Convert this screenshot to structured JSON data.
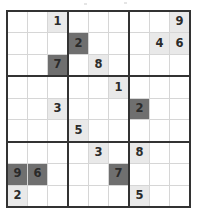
{
  "puzzle": {
    "name": "sudoku-grid",
    "kind": "sudoku",
    "size": 9,
    "box_rows": 3,
    "box_cols": 3,
    "colors": {
      "background": "#ffffff",
      "cell_line": "#d6d6d6",
      "box_line": "#333333",
      "shade_light": "#e9e9e9",
      "shade_dark": "#6f6f6f",
      "digit": "#2b2b2b"
    },
    "legend": {
      "light_label": "light-shaded-cell",
      "dark_label": "dark-shaded-cell",
      "empty_label": "empty-cell"
    },
    "rows": [
      [
        {
          "value": "",
          "shade": "none"
        },
        {
          "value": "",
          "shade": "none"
        },
        {
          "value": "1",
          "shade": "light"
        },
        {
          "value": "",
          "shade": "none"
        },
        {
          "value": "",
          "shade": "none"
        },
        {
          "value": "",
          "shade": "none"
        },
        {
          "value": "",
          "shade": "none"
        },
        {
          "value": "",
          "shade": "none"
        },
        {
          "value": "9",
          "shade": "light"
        }
      ],
      [
        {
          "value": "",
          "shade": "none"
        },
        {
          "value": "",
          "shade": "none"
        },
        {
          "value": "",
          "shade": "none"
        },
        {
          "value": "2",
          "shade": "dark"
        },
        {
          "value": "",
          "shade": "none"
        },
        {
          "value": "",
          "shade": "none"
        },
        {
          "value": "",
          "shade": "none"
        },
        {
          "value": "4",
          "shade": "light"
        },
        {
          "value": "6",
          "shade": "light"
        }
      ],
      [
        {
          "value": "",
          "shade": "none"
        },
        {
          "value": "",
          "shade": "none"
        },
        {
          "value": "7",
          "shade": "dark"
        },
        {
          "value": "",
          "shade": "none"
        },
        {
          "value": "8",
          "shade": "light"
        },
        {
          "value": "",
          "shade": "none"
        },
        {
          "value": "",
          "shade": "none"
        },
        {
          "value": "",
          "shade": "none"
        },
        {
          "value": "",
          "shade": "none"
        }
      ],
      [
        {
          "value": "",
          "shade": "none"
        },
        {
          "value": "",
          "shade": "none"
        },
        {
          "value": "",
          "shade": "none"
        },
        {
          "value": "",
          "shade": "none"
        },
        {
          "value": "",
          "shade": "none"
        },
        {
          "value": "1",
          "shade": "light"
        },
        {
          "value": "",
          "shade": "none"
        },
        {
          "value": "",
          "shade": "none"
        },
        {
          "value": "",
          "shade": "none"
        }
      ],
      [
        {
          "value": "",
          "shade": "none"
        },
        {
          "value": "",
          "shade": "none"
        },
        {
          "value": "3",
          "shade": "light"
        },
        {
          "value": "",
          "shade": "none"
        },
        {
          "value": "",
          "shade": "none"
        },
        {
          "value": "",
          "shade": "none"
        },
        {
          "value": "2",
          "shade": "dark"
        },
        {
          "value": "",
          "shade": "none"
        },
        {
          "value": "",
          "shade": "none"
        }
      ],
      [
        {
          "value": "",
          "shade": "none"
        },
        {
          "value": "",
          "shade": "none"
        },
        {
          "value": "",
          "shade": "none"
        },
        {
          "value": "5",
          "shade": "light"
        },
        {
          "value": "",
          "shade": "none"
        },
        {
          "value": "",
          "shade": "none"
        },
        {
          "value": "",
          "shade": "none"
        },
        {
          "value": "",
          "shade": "none"
        },
        {
          "value": "",
          "shade": "none"
        }
      ],
      [
        {
          "value": "",
          "shade": "none"
        },
        {
          "value": "",
          "shade": "none"
        },
        {
          "value": "",
          "shade": "none"
        },
        {
          "value": "",
          "shade": "none"
        },
        {
          "value": "3",
          "shade": "light"
        },
        {
          "value": "",
          "shade": "none"
        },
        {
          "value": "8",
          "shade": "light"
        },
        {
          "value": "",
          "shade": "none"
        },
        {
          "value": "",
          "shade": "none"
        }
      ],
      [
        {
          "value": "9",
          "shade": "dark"
        },
        {
          "value": "6",
          "shade": "dark"
        },
        {
          "value": "",
          "shade": "none"
        },
        {
          "value": "",
          "shade": "none"
        },
        {
          "value": "",
          "shade": "none"
        },
        {
          "value": "7",
          "shade": "dark"
        },
        {
          "value": "",
          "shade": "none"
        },
        {
          "value": "",
          "shade": "none"
        },
        {
          "value": "",
          "shade": "none"
        }
      ],
      [
        {
          "value": "2",
          "shade": "light"
        },
        {
          "value": "",
          "shade": "none"
        },
        {
          "value": "",
          "shade": "none"
        },
        {
          "value": "",
          "shade": "none"
        },
        {
          "value": "",
          "shade": "none"
        },
        {
          "value": "",
          "shade": "none"
        },
        {
          "value": "5",
          "shade": "light"
        },
        {
          "value": "",
          "shade": "none"
        },
        {
          "value": "",
          "shade": "none"
        }
      ]
    ]
  }
}
